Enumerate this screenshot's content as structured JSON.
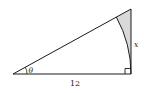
{
  "figure": {
    "type": "right-triangle",
    "labels": {
      "angle": "θ",
      "base": "12",
      "opposite": "x"
    },
    "colors": {
      "stroke": "#1a1a1a",
      "shade": "#d9d9d9",
      "background": "#ffffff"
    }
  }
}
